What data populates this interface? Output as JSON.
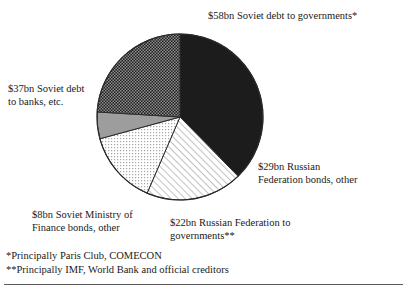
{
  "figure": {
    "background_color": "#ffffff",
    "text_color": "#1a1a1a",
    "rule_color": "#5a5a5a"
  },
  "labels": {
    "soviet_debt_governments": "$58bn Soviet debt to governments*",
    "soviet_debt_banks": "$37bn Soviet debt\nto banks, etc.",
    "russian_federation_bonds": "$29bn Russian\nFederation bonds, other",
    "soviet_ministry_finance_bonds": "$8bn Soviet Ministry of\nFinance bonds, other",
    "russian_federation_governments": "$22bn Russian Federation to\ngovernments**"
  },
  "footnotes": {
    "single_asterisk": "*Principally Paris Club, COMECON",
    "double_asterisk": "**Principally IMF, World Bank and official creditors"
  },
  "chart_data": {
    "type": "pie",
    "title": "",
    "unit": "US$ billion",
    "total": 154,
    "legend_position": "callout-labels",
    "grid": false,
    "center": {
      "x": 180,
      "y": 117
    },
    "radius": 83,
    "start_angle_deg": 90,
    "direction": "clockwise",
    "categories": [
      "Soviet debt to governments*",
      "Russian Federation bonds, other",
      "Russian Federation to governments**",
      "Soviet Ministry of Finance bonds, other",
      "Soviet debt to banks, etc."
    ],
    "values": [
      58,
      29,
      22,
      8,
      37
    ],
    "value_labels": [
      "$58bn",
      "$29bn",
      "$22bn",
      "$8bn",
      "$37bn"
    ],
    "percentages": [
      37.7,
      18.8,
      14.3,
      5.2,
      24.0
    ],
    "slices": [
      {
        "name": "Soviet debt to governments*",
        "value": 58,
        "value_label": "$58bn",
        "percent": 37.7,
        "fill_style": "solid-black",
        "fill_color": "#1c1c1c",
        "start_angle_deg": 90,
        "end_angle_deg": 225.6
      },
      {
        "name": "Russian Federation bonds, other",
        "value": 29,
        "value_label": "$29bn",
        "percent": 18.8,
        "fill_style": "diagonal-hatch",
        "fill_color": "#ffffff",
        "pattern_color": "#8a8a8a",
        "start_angle_deg": 0,
        "end_angle_deg": 67.8
      },
      {
        "name": "Russian Federation to governments**",
        "value": 22,
        "value_label": "$22bn",
        "percent": 14.3,
        "fill_style": "fine-dot",
        "fill_color": "#ffffff",
        "pattern_color": "#9a9a9a",
        "start_angle_deg": 67.8,
        "end_angle_deg": 119.2
      },
      {
        "name": "Soviet Ministry of Finance bonds, other",
        "value": 8,
        "value_label": "$8bn",
        "percent": 5.2,
        "fill_style": "solid-gray",
        "fill_color": "#9d9d9d",
        "start_angle_deg": 119.2,
        "end_angle_deg": 137.9
      },
      {
        "name": "Soviet debt to banks, etc.",
        "value": 37,
        "value_label": "$37bn",
        "percent": 24.0,
        "fill_style": "dark-checker",
        "fill_color": "#2e2e2e",
        "pattern_color": "#8c8c8c",
        "start_angle_deg": 137.9,
        "end_angle_deg": 224.4
      }
    ],
    "outline_color": "#2b2b2b",
    "outline_width": 1
  }
}
